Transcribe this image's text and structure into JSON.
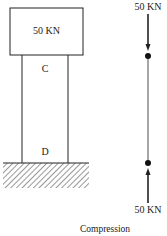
{
  "diagram": {
    "load_block": {
      "label": "50 KN"
    },
    "column": {
      "top_label": "C",
      "bottom_label": "D"
    },
    "ground": {
      "type": "fixed-support-hatched"
    },
    "free_body": {
      "top_force": {
        "label": "50 KN",
        "direction": "down"
      },
      "bottom_force": {
        "label": "50 KN",
        "direction": "up"
      }
    },
    "caption": "Compression"
  }
}
